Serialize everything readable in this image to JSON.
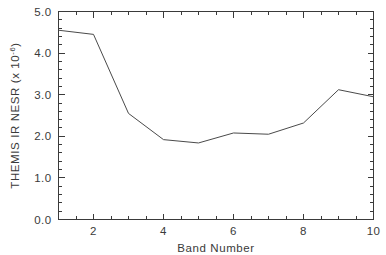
{
  "chart_data": {
    "type": "line",
    "title": "",
    "subtitle": "",
    "xlabel": "Band Number",
    "ylabel": "THEMIS IR NESR (x 10",
    "ylabel_exponent": "-6",
    "ylabel_suffix": ")",
    "x": [
      1,
      2,
      3,
      4,
      5,
      6,
      7,
      8,
      9,
      10
    ],
    "values": [
      4.55,
      4.45,
      2.55,
      1.92,
      1.84,
      2.08,
      2.05,
      2.32,
      3.12,
      2.95
    ],
    "series": [
      {
        "name": "THEMIS IR NESR",
        "values": [
          4.55,
          4.45,
          2.55,
          1.92,
          1.84,
          2.08,
          2.05,
          2.32,
          3.12,
          2.95
        ]
      }
    ],
    "xlim": [
      1,
      10
    ],
    "ylim": [
      0.0,
      5.0
    ],
    "xticks": [
      2,
      4,
      6,
      8,
      10
    ],
    "xtick_labels": [
      "2",
      "4",
      "6",
      "8",
      "10"
    ],
    "xtick_minor_step": 0.5,
    "yticks": [
      0.0,
      1.0,
      2.0,
      3.0,
      4.0,
      5.0
    ],
    "ytick_labels": [
      "0.0",
      "1.0",
      "2.0",
      "3.0",
      "4.0",
      "5.0"
    ],
    "ytick_minor_step": 0.2,
    "grid": false,
    "legend": false,
    "legend_position": "none",
    "line_color": "#4a4a4a",
    "axis_color": "#3a3a3a",
    "background_color": "#ffffff",
    "tick_direction": "in",
    "frame": "box"
  }
}
